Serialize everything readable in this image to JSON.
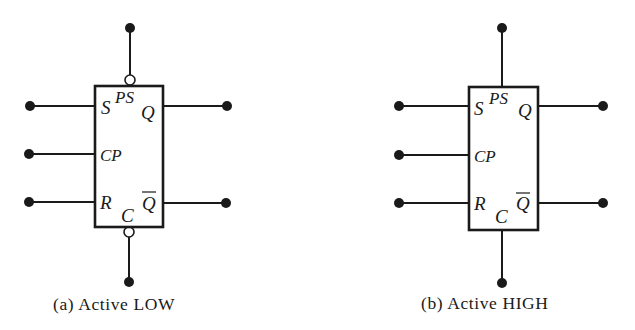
{
  "figure": {
    "diagrams": [
      {
        "id": "a",
        "caption": "(a) Active LOW",
        "pins": {
          "S": "S",
          "PS": "PS",
          "Q": "Q",
          "CP": "CP",
          "R": "R",
          "C": "C",
          "Qbar": "Q"
        },
        "preset_inverted": true,
        "clear_inverted": true
      },
      {
        "id": "b",
        "caption": "(b) Active HIGH",
        "pins": {
          "S": "S",
          "PS": "PS",
          "Q": "Q",
          "CP": "CP",
          "R": "R",
          "C": "C",
          "Qbar": "Q"
        },
        "preset_inverted": false,
        "clear_inverted": false
      }
    ],
    "colors": {
      "ink": "#1a1a1a",
      "background": "#ffffff"
    }
  }
}
